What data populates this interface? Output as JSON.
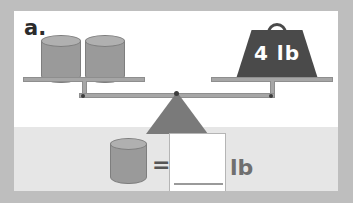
{
  "page": {
    "background_color": "#bebebe",
    "card_background_color": "#ffffff",
    "lower_band_color": "#e6e6e6"
  },
  "problem": {
    "label": "a.",
    "type": "balance-scale-equation"
  },
  "balance": {
    "state": "level",
    "left_pan": {
      "items": [
        {
          "shape": "cylinder",
          "name": "cylinder-1",
          "color": "#9a9a9a"
        },
        {
          "shape": "cylinder",
          "name": "cylinder-2",
          "color": "#9a9a9a"
        }
      ],
      "item_count": 2
    },
    "right_pan": {
      "items": [
        {
          "shape": "weight-block",
          "name": "weight-4lb",
          "label": "4 lb",
          "value": 4,
          "unit": "lb",
          "color": "#4a4a4a"
        }
      ],
      "item_count": 1
    },
    "fulcrum": {
      "shape": "triangle",
      "color": "#7a7a7a"
    },
    "beam_color": "#a6a6a6"
  },
  "equation": {
    "left_operand": {
      "shape": "cylinder",
      "name": "cylinder-unknown",
      "color": "#9a9a9a"
    },
    "operator": "=",
    "answer_value": "",
    "unit_label": "lb"
  }
}
